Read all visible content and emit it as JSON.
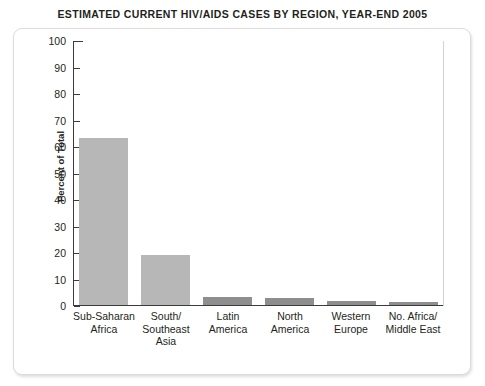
{
  "chart_data": {
    "type": "bar",
    "title": "ESTIMATED CURRENT HIV/AIDS CASES BY REGION, YEAR-END 2005",
    "xlabel": "",
    "ylabel": "Percent of Total",
    "ylim": [
      0,
      100
    ],
    "ytick_step": 10,
    "yticks": [
      100,
      90,
      80,
      70,
      60,
      50,
      40,
      30,
      20,
      10,
      0
    ],
    "grid": false,
    "legend": false,
    "bar_color": "#b7b7b7",
    "bar_color_dark": "#8e8e8e",
    "axis_color": "#3b3b3b",
    "categories": [
      "Sub-Saharan Africa",
      "South/Southeast Asia",
      "Latin America",
      "North America",
      "Western Europe",
      "No. Africa/Middle East"
    ],
    "category_lines": [
      [
        "Sub-Saharan",
        "Africa"
      ],
      [
        "South/",
        "Southeast",
        "Asia"
      ],
      [
        "Latin",
        "America"
      ],
      [
        "North",
        "America"
      ],
      [
        "Western",
        "Europe"
      ],
      [
        "No. Africa/",
        "Middle East"
      ]
    ],
    "values": [
      63,
      19,
      3,
      2.5,
      1.5,
      1
    ]
  }
}
